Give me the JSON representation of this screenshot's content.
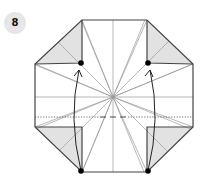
{
  "step": {
    "number": "8",
    "badge_bg": "#e6e6e6",
    "badge_fg": "#111111"
  },
  "diagram": {
    "colors": {
      "outline": "#444444",
      "crease": "#9a9a9a",
      "shade": "#e2e2e2",
      "arrow": "#222222",
      "dot": "#000000"
    },
    "center": [
      113,
      97
    ],
    "octagon": [
      [
        82,
        20
      ],
      [
        147,
        20
      ],
      [
        193,
        64
      ],
      [
        193,
        127
      ],
      [
        147,
        172
      ],
      [
        82,
        172
      ],
      [
        35,
        127
      ],
      [
        35,
        64
      ]
    ],
    "shaded_flaps": [
      [
        [
          35,
          64
        ],
        [
          82,
          20
        ],
        [
          82,
          63
        ]
      ],
      [
        [
          193,
          64
        ],
        [
          147,
          20
        ],
        [
          147,
          63
        ]
      ],
      [
        [
          35,
          127
        ],
        [
          82,
          127
        ],
        [
          82,
          172
        ]
      ],
      [
        [
          193,
          127
        ],
        [
          147,
          127
        ],
        [
          147,
          172
        ]
      ]
    ],
    "dots": [
      [
        81,
        63
      ],
      [
        148,
        63
      ],
      [
        81,
        171
      ],
      [
        148,
        171
      ]
    ],
    "fold_line_y": 117,
    "arrows": [
      {
        "from": [
          81,
          171
        ],
        "to": [
          79,
          66
        ]
      },
      {
        "from": [
          148,
          171
        ],
        "to": [
          150,
          66
        ]
      }
    ]
  }
}
